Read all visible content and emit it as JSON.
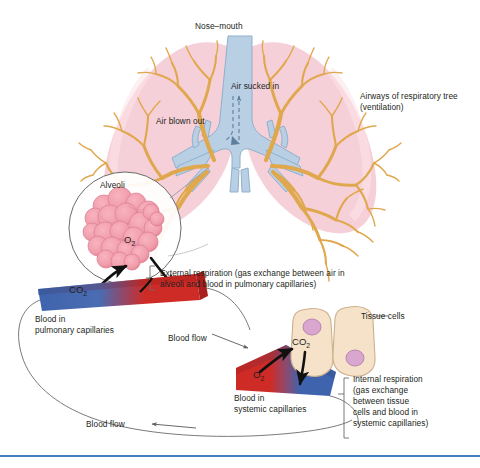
{
  "figure": {
    "accent_rule_color": "#3f7fc1"
  },
  "labels": {
    "nose_mouth": "Nose–mouth",
    "air_sucked_in": "Air sucked in",
    "air_blown_out": "Air blown out",
    "airways_line1": "Airways of respiratory tree",
    "airways_line2": "(ventilation)",
    "alveoli": "Alveoli",
    "o2_alveoli": "O",
    "o2_alveoli_sub": "2",
    "co2_pulmonary": "CO",
    "co2_pulmonary_sub": "2",
    "external_resp_line1": "External respiration (gas exchange between air in",
    "external_resp_line2": "alveoli and blood in pulmonary capillaries)",
    "blood_pulmonary_line1": "Blood in",
    "blood_pulmonary_line2": "pulmonary capillaries",
    "blood_flow_mid": "Blood flow",
    "blood_flow_bottom": "Blood flow",
    "tissue_cells": "Tissue cells",
    "co2_tissue": "CO",
    "co2_tissue_sub": "2",
    "o2_systemic": "O",
    "o2_systemic_sub": "2",
    "blood_systemic_line1": "Blood in",
    "blood_systemic_line2": "systemic capillaries",
    "internal_resp_line1": "Internal respiration",
    "internal_resp_line2": "(gas exchange",
    "internal_resp_line3": "between tissue",
    "internal_resp_line4": "cells and blood in",
    "internal_resp_line5": "systemic capillaries)"
  },
  "colors": {
    "lung_tissue": "#f6cdd6",
    "lung_tissue_light": "#fadfe6",
    "airway_tree": "#e0a84e",
    "trachea_blue": "#b9cfe4",
    "trachea_stroke": "#8fb0cc",
    "alveoli_pink": "#f29aa8",
    "alveoli_pink_dark": "#e0798c",
    "vessel_blue": "#3f63ad",
    "vessel_red": "#cf2b26",
    "cell_fill": "#f6e2c9",
    "cell_stroke": "#cbb08c",
    "nucleus": "#d9a6cf",
    "leader_line": "#6b6b6b",
    "arrow_black": "#1a1a1a",
    "rule": "#3f7fc1"
  }
}
